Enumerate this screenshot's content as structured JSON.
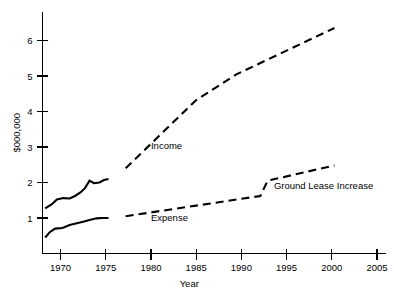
{
  "chart_data": {
    "type": "line",
    "title": "",
    "xlabel": "Year",
    "ylabel": "$000,000",
    "xlim": [
      1968,
      2006
    ],
    "ylim": [
      0,
      6.8
    ],
    "grid": false,
    "legend_position": "inline-annotations",
    "xticks": [
      "1970",
      "1975",
      "1980",
      "1985",
      "1990",
      "1995",
      "2000",
      "2005"
    ],
    "xtick_values": [
      1970,
      1975,
      1980,
      1985,
      1990,
      1995,
      2000,
      2005
    ],
    "yticks": [
      "1",
      "2",
      "3",
      "4",
      "5",
      "6"
    ],
    "ytick_values": [
      1,
      2,
      3,
      4,
      5,
      6
    ],
    "series": [
      {
        "name": "Income history",
        "style": "solid",
        "x": [
          1968.3,
          1969.0,
          1969.6,
          1970.3,
          1971.0,
          1971.6,
          1972.2,
          1972.7,
          1973.2,
          1973.7,
          1974.3,
          1974.8,
          1975.3
        ],
        "values": [
          1.27,
          1.38,
          1.52,
          1.56,
          1.55,
          1.62,
          1.72,
          1.84,
          2.05,
          1.98,
          2.0,
          2.07,
          2.1
        ]
      },
      {
        "name": "Expense history",
        "style": "solid",
        "x": [
          1968.3,
          1968.8,
          1969.4,
          1970.2,
          1971.0,
          1971.8,
          1972.6,
          1973.3,
          1974.0,
          1974.6,
          1975.3
        ],
        "values": [
          0.45,
          0.6,
          0.7,
          0.72,
          0.8,
          0.85,
          0.9,
          0.95,
          0.99,
          1.0,
          1.0
        ]
      },
      {
        "name": "Income",
        "style": "dashed",
        "x": [
          1977.2,
          1985.0,
          1989.5,
          2000.3
        ],
        "values": [
          2.4,
          4.32,
          5.05,
          6.35
        ]
      },
      {
        "name": "Expense",
        "style": "dashed",
        "x": [
          1977.2,
          1992.1,
          1992.9,
          2000.3
        ],
        "values": [
          1.05,
          1.62,
          2.05,
          2.48
        ]
      }
    ],
    "annotations": [
      {
        "text": "Income",
        "x": 1980.0,
        "y": 2.95
      },
      {
        "text": "Expense",
        "x": 1980.0,
        "y": 0.92
      },
      {
        "text": "Ground Lease Increase",
        "x": 1993.6,
        "y": 1.82
      }
    ]
  }
}
